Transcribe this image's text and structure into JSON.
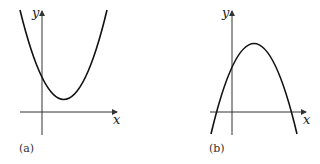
{
  "panels": [
    {
      "id": "a",
      "caption": "(a)",
      "x_axis_label": "x",
      "y_axis_label": "y",
      "curve": "upward-opening parabola, vertex above x-axis to the right of y-axis, positive y-intercept"
    },
    {
      "id": "b",
      "caption": "(b)",
      "x_axis_label": "x",
      "y_axis_label": "y",
      "curve": "downward-opening parabola, vertex right of y-axis, two x-intercepts (one negative, one positive), positive y-intercept"
    }
  ],
  "colors": {
    "stroke": "#111111",
    "axis": "#333333"
  }
}
